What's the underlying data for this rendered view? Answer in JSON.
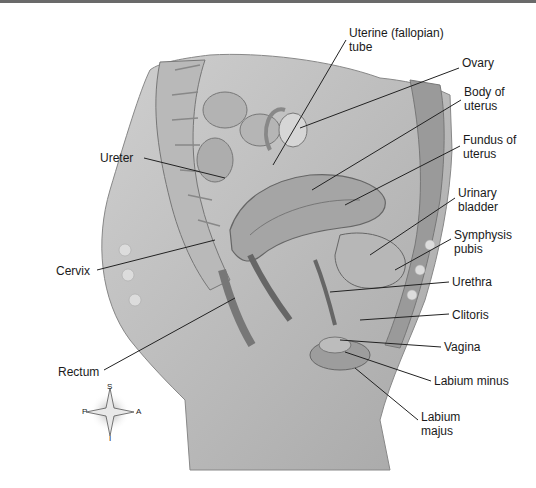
{
  "figure": {
    "type": "anatomical illustration"
  },
  "labels": [
    {
      "id": "uterine-tube",
      "text": "Uterine (fallopian)\ntube",
      "x": 349,
      "y": 33
    },
    {
      "id": "ovary",
      "text": "Ovary",
      "x": 462,
      "y": 63
    },
    {
      "id": "body-of-uterus",
      "text": "Body of\nuterus",
      "x": 464,
      "y": 90
    },
    {
      "id": "fundus-of-uterus",
      "text": "Fundus of\nuterus",
      "x": 463,
      "y": 136
    },
    {
      "id": "urinary-bladder",
      "text": "Urinary\nbladder",
      "x": 458,
      "y": 189
    },
    {
      "id": "symphysis-pubis",
      "text": "Symphysis\npubis",
      "x": 454,
      "y": 229
    },
    {
      "id": "urethra",
      "text": "Urethra",
      "x": 452,
      "y": 275
    },
    {
      "id": "clitoris",
      "text": "Clitoris",
      "x": 452,
      "y": 307
    },
    {
      "id": "vagina",
      "text": "Vagina",
      "x": 444,
      "y": 340
    },
    {
      "id": "labium-minus",
      "text": "Labium minus",
      "x": 434,
      "y": 374
    },
    {
      "id": "labium-majus",
      "text": "Labium\nmajus",
      "x": 421,
      "y": 410
    },
    {
      "id": "ureter",
      "text": "Ureter",
      "x": 112,
      "y": 152
    },
    {
      "id": "cervix",
      "text": "Cervix",
      "x": 58,
      "y": 264
    },
    {
      "id": "rectum",
      "text": "Rectum",
      "x": 60,
      "y": 364
    }
  ],
  "compass": {
    "superior": "S",
    "posterior": "P",
    "anterior": "A",
    "inferior": "I"
  }
}
